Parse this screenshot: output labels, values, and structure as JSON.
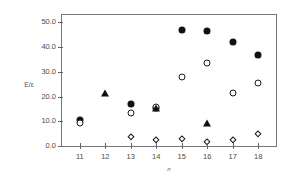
{
  "chart_data": {
    "type": "scatter",
    "title": "",
    "xlabel": "n",
    "ylabel": "E/ε",
    "xlim": [
      10.3,
      18.7
    ],
    "ylim": [
      0.0,
      53.0
    ],
    "grid": false,
    "legend": "none",
    "x_ticks": [
      "11",
      "12",
      "13",
      "14",
      "15",
      "16",
      "17",
      "18"
    ],
    "x_tick_values": [
      11,
      12,
      13,
      14,
      15,
      16,
      17,
      18
    ],
    "y_ticks": [
      "0.0",
      "10.0",
      "20.0",
      "30.0",
      "40.0",
      "50.0"
    ],
    "y_tick_values": [
      0.0,
      10.0,
      20.0,
      30.0,
      40.0,
      50.0
    ],
    "series": [
      {
        "name": "filled-circle",
        "marker": "filled-circle",
        "x": [
          11,
          13,
          14,
          15,
          16,
          17,
          18
        ],
        "values": [
          10.5,
          17.0,
          15.4,
          46.8,
          46.5,
          42.0,
          36.9
        ]
      },
      {
        "name": "open-circle",
        "marker": "open-circle",
        "x": [
          11,
          13,
          14,
          15,
          16,
          17,
          18
        ],
        "values": [
          9.3,
          13.2,
          15.9,
          27.9,
          33.4,
          21.6,
          25.3
        ]
      },
      {
        "name": "filled-triangle",
        "marker": "filled-triangle",
        "x": [
          12,
          14,
          16
        ],
        "values": [
          20.9,
          14.9,
          8.9
        ]
      },
      {
        "name": "open-diamond",
        "marker": "open-diamond",
        "x": [
          13,
          14,
          15,
          16,
          17,
          18
        ],
        "values": [
          3.8,
          2.5,
          2.9,
          1.5,
          2.3,
          4.9
        ]
      }
    ]
  }
}
